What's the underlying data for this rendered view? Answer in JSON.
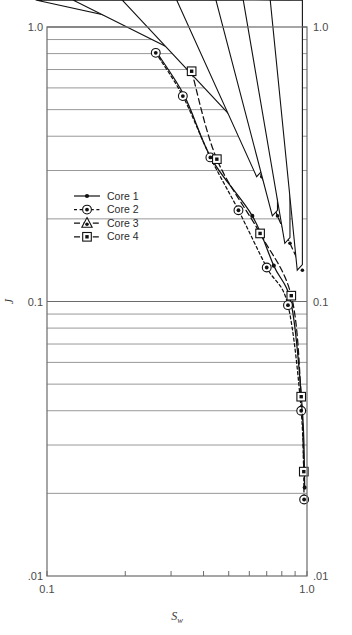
{
  "figure": {
    "background": "#ffffff",
    "frame_color": "#6b6b6b",
    "grid_color": "#8c8c8c",
    "series_color": "#111111"
  },
  "axis": {
    "y_left_top_label": "1.0",
    "y_left_mid_label": "0.1",
    "y_left_bottom_label": ".01",
    "y_right_top_label": "1.0",
    "y_right_mid_label": "0.1",
    "y_right_bottom_label": ".01",
    "x_left_label": "0.1",
    "x_right_label": "1.0",
    "y_title": "J",
    "x_title_main": "S",
    "x_title_sub": "w"
  },
  "legend": {
    "items": [
      {
        "label": "Core 1",
        "marker": "filled-dot",
        "dash": "solid"
      },
      {
        "label": "Core 2",
        "marker": "dot-in-circle",
        "dash": "dashed-short"
      },
      {
        "label": "Core 3",
        "marker": "dot-in-triangle",
        "dash": "dashed-long"
      },
      {
        "label": "Core 4",
        "marker": "dot-in-square",
        "dash": "dashed-long"
      }
    ]
  },
  "chart_data": {
    "type": "line",
    "title": "",
    "xlabel": "Sw",
    "ylabel": "J",
    "xscale": "log",
    "yscale": "log",
    "xlim": [
      0.1,
      1.0
    ],
    "ylim": [
      0.01,
      1.0
    ],
    "grid": "horizontal-minor-and-major",
    "legend_position": "center-left-inside",
    "xticks": [
      0.1,
      0.2,
      0.3,
      0.4,
      0.5,
      0.6,
      0.7,
      0.8,
      0.9,
      1.0
    ],
    "xtick_labels": [
      "0.1",
      "",
      "",
      "",
      "",
      "",
      "",
      "",
      "",
      "1.0"
    ],
    "yticks": [
      0.01,
      0.1,
      1.0
    ],
    "ytick_labels": [
      ".01",
      "0.1",
      "1.0"
    ],
    "series": [
      {
        "name": "Core 1",
        "marker": "filled-dot",
        "dash": "solid",
        "points": [
          {
            "x": 0.266,
            "y": 0.8
          },
          {
            "x": 0.338,
            "y": 0.56
          },
          {
            "x": 0.43,
            "y": 0.33
          },
          {
            "x": 0.616,
            "y": 0.205
          },
          {
            "x": 0.745,
            "y": 0.135
          },
          {
            "x": 0.872,
            "y": 0.097
          },
          {
            "x": 0.96,
            "y": 0.04
          },
          {
            "x": 0.98,
            "y": 0.021
          }
        ]
      },
      {
        "name": "Core 2",
        "marker": "dot-in-circle",
        "dash": "dashed-short",
        "points": [
          {
            "x": 0.262,
            "y": 0.805
          },
          {
            "x": 0.333,
            "y": 0.56
          },
          {
            "x": 0.425,
            "y": 0.335
          },
          {
            "x": 0.545,
            "y": 0.215
          },
          {
            "x": 0.7,
            "y": 0.133
          },
          {
            "x": 0.845,
            "y": 0.097
          },
          {
            "x": 0.95,
            "y": 0.04
          },
          {
            "x": 0.975,
            "y": 0.019
          }
        ]
      },
      {
        "name": "Core 3",
        "marker": "dot-in-triangle",
        "dash": "dashed-long",
        "points": [
          {
            "x": 0.4,
            "y": 0.93
          },
          {
            "x": 0.48,
            "y": 0.68
          },
          {
            "x": 0.56,
            "y": 0.45
          },
          {
            "x": 0.67,
            "y": 0.285
          },
          {
            "x": 0.77,
            "y": 0.205
          },
          {
            "x": 0.86,
            "y": 0.163
          },
          {
            "x": 0.96,
            "y": 0.13
          }
        ]
      },
      {
        "name": "Core 4",
        "marker": "dot-in-square",
        "dash": "dashed-long",
        "points": [
          {
            "x": 0.36,
            "y": 0.69
          },
          {
            "x": 0.45,
            "y": 0.33
          },
          {
            "x": 0.66,
            "y": 0.177
          },
          {
            "x": 0.87,
            "y": 0.105
          },
          {
            "x": 0.95,
            "y": 0.045
          },
          {
            "x": 0.972,
            "y": 0.024
          }
        ]
      }
    ]
  }
}
